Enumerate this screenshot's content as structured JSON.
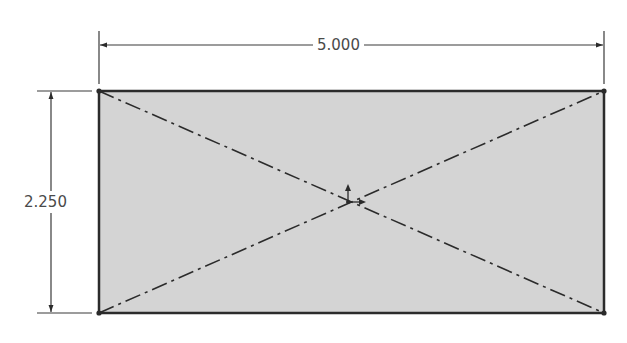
{
  "sketch": {
    "rectangle": {
      "x": 99,
      "y": 91,
      "width": 505,
      "height": 222,
      "fill": "#d4d4d4",
      "stroke": "#2b2b2b"
    },
    "construction_lines": [
      {
        "name": "diagonal-1",
        "x1": 99,
        "y1": 91,
        "x2": 604,
        "y2": 313
      },
      {
        "name": "diagonal-2",
        "x1": 99,
        "y1": 313,
        "x2": 604,
        "y2": 91
      }
    ],
    "origin": {
      "x": 348,
      "y": 202
    }
  },
  "dimensions": {
    "width": {
      "label": "5.000",
      "y": 45
    },
    "height": {
      "label": "2.250",
      "x": 51
    }
  },
  "colors": {
    "line": "#2b2b2b",
    "fill": "#d4d4d4",
    "dimension": "#3a3a3a",
    "text": "#4a4a4a"
  }
}
